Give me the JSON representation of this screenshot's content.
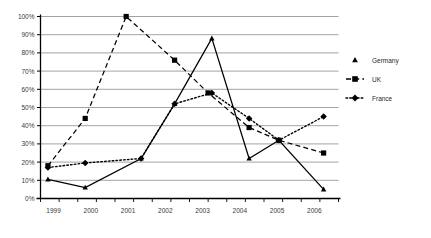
{
  "chart_data": {
    "type": "line",
    "title": "",
    "subtitle": "",
    "xlabel": "",
    "ylabel": "",
    "ylim": [
      0,
      100
    ],
    "xlim": [
      1999,
      2007
    ],
    "grid": true,
    "legend_position": "right",
    "y_ticks": [
      "0%",
      "10%",
      "20%",
      "30%",
      "40%",
      "50%",
      "60%",
      "70%",
      "80%",
      "90%",
      "100%"
    ],
    "y_tick_values": [
      0,
      10,
      20,
      30,
      40,
      50,
      60,
      70,
      80,
      90,
      100
    ],
    "x_tick_labels": [
      "1999",
      "2000",
      "2001",
      "2002",
      "2003",
      "2004",
      "2005",
      "2006"
    ],
    "x_tick_values": [
      1999,
      2000,
      2001,
      2002,
      2003,
      2004,
      2005,
      2006
    ],
    "x": [
      1999.2,
      2000.2,
      2001.2,
      2001.7,
      2002.6,
      2003.4,
      2004.4,
      2005.4,
      2006.4
    ],
    "series": [
      {
        "name": "Germany",
        "marker": "triangle",
        "line_style": "solid",
        "color": "#000000",
        "x": [
          1999.2,
          2000.2,
          2001.7,
          2002.6,
          2003.6,
          2004.6,
          2005.4,
          2006.6
        ],
        "values": [
          10.5,
          6,
          22,
          52,
          88,
          22,
          32,
          5
        ]
      },
      {
        "name": "UK",
        "marker": "square",
        "line_style": "dashed",
        "color": "#000000",
        "x": [
          1999.2,
          2000.2,
          2001.3,
          2002.6,
          2003.5,
          2004.6,
          2005.4,
          2006.6
        ],
        "values": [
          18,
          44,
          100,
          76,
          58,
          39,
          32,
          25
        ]
      },
      {
        "name": "France",
        "marker": "diamond",
        "line_style": "dotted",
        "color": "#000000",
        "x": [
          1999.2,
          2000.2,
          2001.7,
          2002.6,
          2003.6,
          2004.6,
          2005.4,
          2006.6
        ],
        "values": [
          17,
          19.5,
          22,
          52,
          58,
          44,
          32,
          45
        ]
      }
    ]
  },
  "legend": {
    "items": [
      {
        "label": "Germany",
        "marker": "triangle",
        "line_style": "none"
      },
      {
        "label": "UK",
        "marker": "square",
        "line_style": "dashed"
      },
      {
        "label": "France",
        "marker": "diamond",
        "line_style": "dotted"
      }
    ]
  }
}
